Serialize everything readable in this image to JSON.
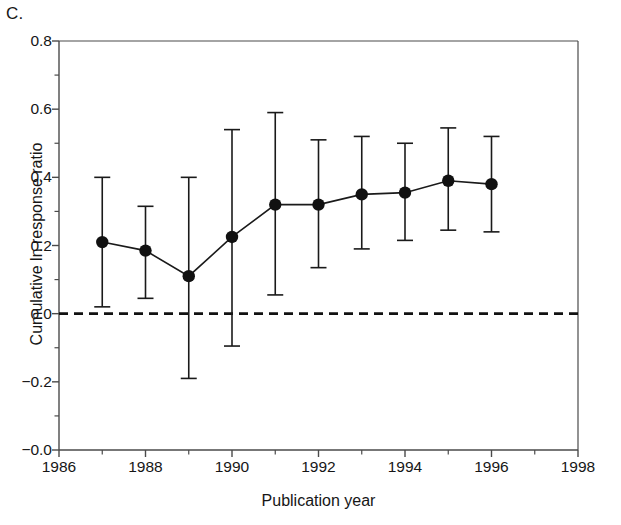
{
  "panel": {
    "label": "C."
  },
  "chart_data": {
    "type": "scatter",
    "title": "",
    "subtitle": "",
    "xlabel": "Publication year",
    "ylabel": "Cumulative ln response ratio",
    "xlim": [
      1986,
      1998
    ],
    "ylim": [
      -0.4,
      0.8
    ],
    "grid": false,
    "legend": null,
    "x_tick_labels": [
      "1986",
      "1988",
      "1990",
      "1992",
      "1994",
      "1996",
      "1998"
    ],
    "x_tick_values": [
      1986,
      1988,
      1990,
      1992,
      1994,
      1996,
      1998
    ],
    "x_minor_tick_values": [
      1987,
      1989,
      1991,
      1993,
      1995,
      1997
    ],
    "y_tick_labels": [
      "0.8",
      "0.6",
      "0.4",
      "0.2",
      "0.0",
      "-0.2",
      "-0.0"
    ],
    "y_tick_values": [
      0.8,
      0.6,
      0.4,
      0.2,
      0.0,
      -0.2,
      -0.4
    ],
    "y_minor_tick_values": [
      0.7,
      0.5,
      0.3,
      0.1,
      -0.1,
      -0.3
    ],
    "reference_line": {
      "y": 0.0,
      "style": "dashed"
    },
    "marker": "filled-circle",
    "error_bar_style": "capped-vertical",
    "x": [
      1987,
      1988,
      1989,
      1990,
      1991,
      1992,
      1993,
      1994,
      1995,
      1996
    ],
    "values": [
      0.21,
      0.185,
      0.11,
      0.225,
      0.32,
      0.32,
      0.35,
      0.355,
      0.39,
      0.38
    ],
    "error_upper": [
      0.4,
      0.315,
      0.4,
      0.54,
      0.59,
      0.51,
      0.52,
      0.5,
      0.545,
      0.52
    ],
    "error_lower": [
      0.02,
      0.045,
      -0.19,
      -0.095,
      0.055,
      0.135,
      0.19,
      0.215,
      0.245,
      0.24
    ],
    "points": [
      {
        "year": 1987,
        "value": 0.21,
        "upper": 0.4,
        "lower": 0.02
      },
      {
        "year": 1988,
        "value": 0.185,
        "upper": 0.315,
        "lower": 0.045
      },
      {
        "year": 1989,
        "value": 0.11,
        "upper": 0.4,
        "lower": -0.19
      },
      {
        "year": 1990,
        "value": 0.225,
        "upper": 0.54,
        "lower": -0.095
      },
      {
        "year": 1991,
        "value": 0.32,
        "upper": 0.59,
        "lower": 0.055
      },
      {
        "year": 1992,
        "value": 0.32,
        "upper": 0.51,
        "lower": 0.135
      },
      {
        "year": 1993,
        "value": 0.35,
        "upper": 0.52,
        "lower": 0.19
      },
      {
        "year": 1994,
        "value": 0.355,
        "upper": 0.5,
        "lower": 0.215
      },
      {
        "year": 1995,
        "value": 0.39,
        "upper": 0.545,
        "lower": 0.245
      },
      {
        "year": 1996,
        "value": 0.38,
        "upper": 0.52,
        "lower": 0.24
      }
    ]
  },
  "style": {
    "axis_color": "#4a4a4a",
    "line_color": "#1a1a1a",
    "marker_color": "#111111",
    "background": "#ffffff"
  }
}
